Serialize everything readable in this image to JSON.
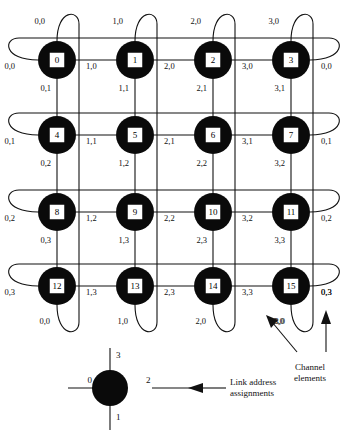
{
  "figure": {
    "type": "network-topology-diagram",
    "topology": "4x4 torus (wrap-around mesh)",
    "grid": {
      "cols": 4,
      "rows": 4
    }
  },
  "nodes": [
    {
      "id": "0",
      "col": 0,
      "row": 0
    },
    {
      "id": "1",
      "col": 1,
      "row": 0
    },
    {
      "id": "2",
      "col": 2,
      "row": 0
    },
    {
      "id": "3",
      "col": 3,
      "row": 0
    },
    {
      "id": "4",
      "col": 0,
      "row": 1
    },
    {
      "id": "5",
      "col": 1,
      "row": 1
    },
    {
      "id": "6",
      "col": 2,
      "row": 1
    },
    {
      "id": "7",
      "col": 3,
      "row": 1
    },
    {
      "id": "8",
      "col": 0,
      "row": 2
    },
    {
      "id": "9",
      "col": 1,
      "row": 2
    },
    {
      "id": "10",
      "col": 2,
      "row": 2
    },
    {
      "id": "11",
      "col": 3,
      "row": 2
    },
    {
      "id": "12",
      "col": 0,
      "row": 3
    },
    {
      "id": "13",
      "col": 1,
      "row": 3
    },
    {
      "id": "14",
      "col": 2,
      "row": 3
    },
    {
      "id": "15",
      "col": 3,
      "row": 3
    }
  ],
  "top_labels": [
    "0,0",
    "1,0",
    "2,0",
    "3,0"
  ],
  "bottom_labels": [
    "0,0",
    "1,0",
    "2,0",
    "3,0"
  ],
  "left_labels": [
    "0,0",
    "0,1",
    "0,2",
    "0,3"
  ],
  "right_labels": [
    "0,0",
    "0,1",
    "0,2",
    "0,3"
  ],
  "horizontal_labels": [
    [
      "1,0",
      "2,0",
      "3,0"
    ],
    [
      "1,1",
      "2,1",
      "3,1"
    ],
    [
      "1,2",
      "2,2",
      "3,2"
    ],
    [
      "1,3",
      "2,3",
      "3,3"
    ]
  ],
  "vertical_labels": [
    [
      "0,1",
      "1,1",
      "2,1",
      "3,1"
    ],
    [
      "0,2",
      "1,2",
      "2,2",
      "3,2"
    ],
    [
      "0,3",
      "1,3",
      "2,3",
      "3,3"
    ]
  ],
  "legend": {
    "link_left": "0",
    "link_bottom": "1",
    "link_right": "2",
    "link_top": "3",
    "caption_line1": "Link address",
    "caption_line2": "assignments"
  },
  "annotations": {
    "channel_line1": "Channel",
    "channel_line2": "elements",
    "channel_label_a": "3,0",
    "channel_label_b": "0,3"
  },
  "colors": {
    "node_fill": "#0a0a0a",
    "node_label_bg": "#ffffff",
    "line": "#111111",
    "background": "#ffffff"
  }
}
